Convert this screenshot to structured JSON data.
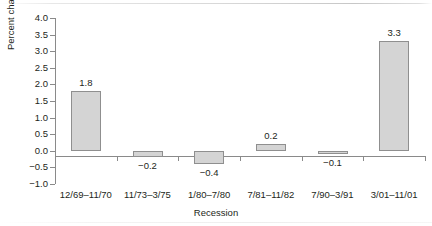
{
  "chart_data": {
    "type": "bar",
    "title": "",
    "xlabel": "Recession",
    "ylabel": "Percent change",
    "categories": [
      "12/69–11/70",
      "11/73–3/75",
      "1/80–7/80",
      "7/81–11/82",
      "7/90–3/91",
      "3/01–11/01"
    ],
    "values": [
      1.8,
      -0.2,
      -0.4,
      0.2,
      -0.1,
      3.3
    ],
    "value_labels": [
      "1.8",
      "−0.2",
      "−0.4",
      "0.2",
      "−0.1",
      "3.3"
    ],
    "ylim": [
      -1.0,
      4.0
    ],
    "ytick_values": [
      4.0,
      3.5,
      3.0,
      2.5,
      2.0,
      1.5,
      1.0,
      0.5,
      0.0,
      -0.5,
      -1.0
    ],
    "ytick_labels": [
      "4.0",
      "3.5",
      "3.0",
      "2.5",
      "2.0",
      "1.5",
      "1.0",
      "0.5",
      "0.0",
      "−0.5",
      "−1.0"
    ],
    "ystep": 0.5,
    "grid": false,
    "legend": false,
    "bar_fill_color": "#d4d4d4",
    "bar_edge_color": "#8f8f8f",
    "axis_color": "#8a8a8a",
    "text_color": "#231f20",
    "background_color": "#ffffff"
  }
}
